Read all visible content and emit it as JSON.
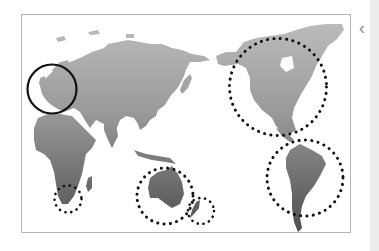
{
  "map": {
    "projection": "pacific-centered world map",
    "land_color_top": "#b4b4b4",
    "land_color_bottom": "#4e4e4e",
    "frame_border_color": "#b4b4b4",
    "highlights": [
      {
        "region": "Europe",
        "style": "solid",
        "cx": 52,
        "cy": 89,
        "r": 25
      },
      {
        "region": "North America",
        "style": "dotted",
        "cx": 278,
        "cy": 87,
        "r": 49
      },
      {
        "region": "South America",
        "style": "dotted",
        "cx": 305,
        "cy": 178,
        "r": 38
      },
      {
        "region": "Australia",
        "style": "dotted",
        "cx": 165,
        "cy": 196,
        "r": 28
      },
      {
        "region": "New Zealand",
        "style": "dotted",
        "cx": 201,
        "cy": 211,
        "r": 13
      },
      {
        "region": "South Africa",
        "style": "dotted",
        "cx": 68,
        "cy": 199,
        "r": 14
      }
    ]
  },
  "sidebar": {
    "collapse_icon": "chevron-left-icon",
    "collapse_glyph": "‹"
  }
}
